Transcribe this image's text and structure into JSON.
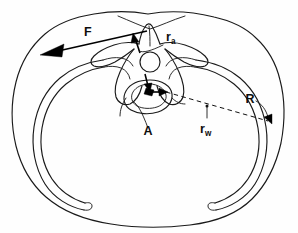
{
  "figure": {
    "background_color": "#fefefe",
    "ink_color": "#1a1a1a",
    "width": 298,
    "height": 233
  },
  "labels": {
    "force": {
      "base": "F",
      "subscript": "",
      "meaning": "applied force vector",
      "x": 88,
      "y": 36
    },
    "r_a": {
      "base": "r",
      "subscript": "a",
      "meaning": "moment arm to applied force",
      "x": 166,
      "y": 41
    },
    "r_w": {
      "base": "r",
      "subscript": "w",
      "meaning": "moment arm to chest wall",
      "x": 200,
      "y": 133
    },
    "radius": {
      "base": "R",
      "subscript": "",
      "meaning": "chest wall radius",
      "x": 250,
      "y": 103
    },
    "point_a": {
      "base": "A",
      "subscript": "",
      "meaning": "anatomical point A (vertebral body / canal)",
      "x": 148,
      "y": 135
    }
  },
  "elements": {
    "body_outline": "outer torso contour",
    "rib_cage": "paired rib outlines, left and right",
    "vertebra": "central thoracic vertebra with transverse and spinous processes",
    "spinal_canal": "small circle superior to vertebral body",
    "vertebral_body": "rounded body inferior to canal",
    "force_vector": "long arrow directed to upper-left labeled F",
    "reaction_arrows": "short arrows at vertebral center",
    "radius_line": "dashed line from vertebral center to right chest wall",
    "radius_arrow": "small arrow at chest wall labeled R"
  },
  "colors": {
    "ink": "#1a1a1a",
    "paper": "#fefefe",
    "vector": "#000000"
  }
}
